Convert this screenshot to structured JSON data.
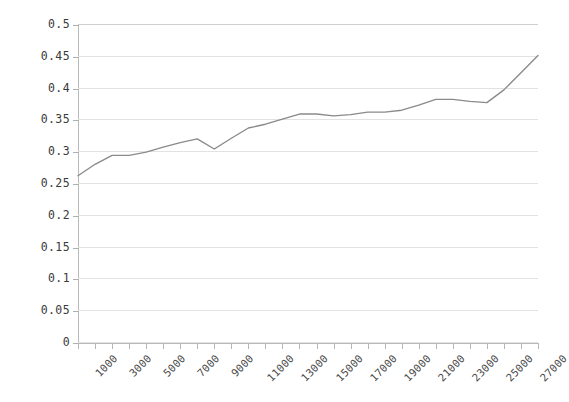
{
  "chart_data": {
    "type": "line",
    "title": "",
    "subtitle": "",
    "xlabel": "",
    "ylabel": "",
    "xlim": [
      1000,
      28000
    ],
    "ylim": [
      0,
      0.5
    ],
    "grid": true,
    "legend": false,
    "legend_position": "none",
    "line_color": "#8a8a8a",
    "grid_color": "#e2e2e2",
    "axis_color": "#b9b9b9",
    "tick_label_color": "#3a3a3a",
    "y_ticks": [
      "0",
      "0.05",
      "0.1",
      "0.15",
      "0.2",
      "0.25",
      "0.3",
      "0.35",
      "0.4",
      "0.45",
      "0.5"
    ],
    "y_tick_values": [
      0,
      0.05,
      0.1,
      0.15,
      0.2,
      0.25,
      0.3,
      0.35,
      0.4,
      0.45,
      0.5
    ],
    "x_ticks": [
      "1000",
      "3000",
      "5000",
      "7000",
      "9000",
      "11000",
      "13000",
      "15000",
      "17000",
      "19000",
      "21000",
      "23000",
      "25000",
      "27000"
    ],
    "x_tick_values": [
      1000,
      3000,
      5000,
      7000,
      9000,
      11000,
      13000,
      15000,
      17000,
      19000,
      21000,
      23000,
      25000,
      27000
    ],
    "x_tick_rotation_deg": -45,
    "series": [
      {
        "name": "series-1",
        "color": "#8a8a8a",
        "x": [
          1000,
          2000,
          3000,
          4000,
          5000,
          6000,
          7000,
          8000,
          9000,
          10000,
          11000,
          12000,
          13000,
          14000,
          15000,
          16000,
          17000,
          18000,
          19000,
          20000,
          21000,
          22000,
          23000,
          24000,
          25000,
          26000,
          27000,
          28000
        ],
        "values": [
          0.263,
          0.281,
          0.295,
          0.295,
          0.3,
          0.308,
          0.315,
          0.321,
          0.305,
          0.322,
          0.338,
          0.344,
          0.352,
          0.36,
          0.36,
          0.357,
          0.359,
          0.363,
          0.363,
          0.366,
          0.374,
          0.383,
          0.383,
          0.38,
          0.378,
          0.398,
          0.425,
          0.452
        ]
      }
    ]
  }
}
